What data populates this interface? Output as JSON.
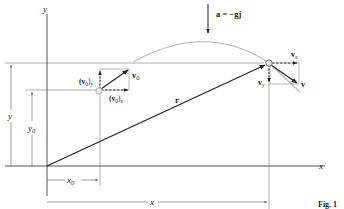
{
  "figure": {
    "caption": "Fig. 1",
    "colors": {
      "axis": "#555555",
      "thin_line": "#9a9a9a",
      "vector": "#222222",
      "trajectory": "#b5b5b5",
      "particle_fill": "#e6e6e6",
      "particle_stroke": "#888888"
    }
  },
  "axes": {
    "x_label": "x",
    "y_label": "y"
  },
  "acceleration": {
    "label": "a = −gj"
  },
  "initial_point": {
    "velocity_label": "v0",
    "velocity_label_main": "v",
    "velocity_label_sub": "0",
    "vx_label_main": "(v",
    "vx_label_sub0": "0",
    "vx_label_close": ")",
    "vx_label_subx": "x",
    "vy_label_main": "(v",
    "vy_label_sub0": "0",
    "vy_label_close": ")",
    "vy_label_suby": "y"
  },
  "current_point": {
    "velocity_label": "v",
    "vx_label_main": "v",
    "vx_label_sub": "x",
    "vy_label_main": "v",
    "vy_label_sub": "y"
  },
  "position_vector": {
    "label": "r"
  },
  "dimensions": {
    "y_label": "y",
    "y0_label_main": "y",
    "y0_label_sub": "0",
    "x_label": "x",
    "x0_label_main": "x",
    "x0_label_sub": "0"
  }
}
